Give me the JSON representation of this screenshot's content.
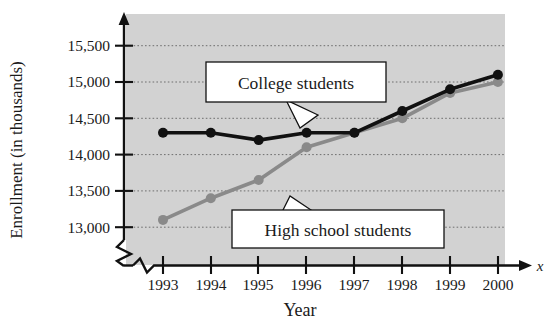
{
  "chart_data": {
    "type": "line",
    "title": "",
    "xlabel": "Year",
    "ylabel": "Enrollment (in thousands)",
    "x_axis_variable": "x",
    "categories": [
      "1993",
      "1994",
      "1995",
      "1996",
      "1997",
      "1998",
      "1999",
      "2000"
    ],
    "x": [
      1993,
      1994,
      1995,
      1996,
      1997,
      1998,
      1999,
      2000
    ],
    "xlim": [
      1993,
      2000
    ],
    "ylim": [
      12850,
      15800
    ],
    "y_ticks": [
      "13,000",
      "13,500",
      "14,000",
      "14,500",
      "15,000",
      "15,500"
    ],
    "y_tick_values": [
      13000,
      13500,
      14000,
      14500,
      15000,
      15500
    ],
    "grid": true,
    "grid_axis": "y",
    "axis_break_y": true,
    "axis_break_x": true,
    "legend": "annotations",
    "legend_position": "inline-callouts",
    "plot_background": "#d2d2d2",
    "series": [
      {
        "name": "College students",
        "color": "#111111",
        "marker": "circle",
        "values": [
          14300,
          14300,
          14200,
          14300,
          14300,
          14600,
          14900,
          15100
        ]
      },
      {
        "name": "High school students",
        "color": "#8a8a8a",
        "marker": "circle",
        "values": [
          13100,
          13400,
          13650,
          14100,
          14300,
          14500,
          14850,
          15000
        ]
      }
    ],
    "annotations": [
      {
        "text": "College students",
        "series": "College students"
      },
      {
        "text": "High school students",
        "series": "High school students"
      }
    ]
  }
}
